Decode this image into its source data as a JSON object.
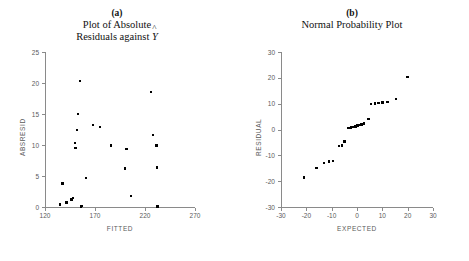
{
  "figure": {
    "background": "#ffffff",
    "point_color": "#000000",
    "axis_color": "#8a8a8a",
    "label_color": "#5a5a5a"
  },
  "panels": [
    {
      "letter": "(a)",
      "title_line1": "Plot of Absolute",
      "title_line2_pre": "Residuals against",
      "title_symbol": "Y",
      "title_symbol_accent": "^"
    },
    {
      "letter": "(b)",
      "title_line1": "Normal Probability Plot",
      "title_line2_pre": "",
      "title_symbol": "",
      "title_symbol_accent": ""
    }
  ],
  "chart_data": [
    {
      "type": "scatter",
      "title": "Plot of Absolute Residuals against Y-hat",
      "panel_letter": "(a)",
      "xlabel": "FITTED",
      "ylabel": "ABSRESID",
      "xlim": [
        120,
        270
      ],
      "ylim": [
        0,
        25
      ],
      "xticks": [
        120,
        170,
        220,
        270
      ],
      "yticks": [
        0,
        5,
        10,
        15,
        20,
        25
      ],
      "grid": false,
      "legend": "none",
      "n_points": 24,
      "x": [
        135.0,
        137.5,
        141.5,
        146.5,
        148.0,
        150.0,
        150.5,
        152.0,
        153.0,
        155.0,
        156.0,
        157.0,
        161.0,
        168.0,
        175.0,
        186.0,
        200.0,
        201.5,
        206.0,
        226.0,
        228.0,
        231.5,
        232.0,
        232.5
      ],
      "y": [
        0.4,
        3.8,
        0.7,
        1.2,
        1.5,
        10.3,
        9.5,
        12.4,
        15.0,
        20.3,
        0.1,
        0.2,
        4.7,
        13.2,
        12.9,
        9.9,
        6.2,
        9.4,
        1.8,
        18.5,
        11.6,
        9.9,
        6.4,
        0.1
      ]
    },
    {
      "type": "scatter",
      "title": "Normal Probability Plot",
      "panel_letter": "(b)",
      "xlabel": "EXPECTED",
      "ylabel": "RESIDUAL",
      "xlim": [
        -30,
        30
      ],
      "ylim": [
        -30,
        30
      ],
      "xticks": [
        -30,
        -20,
        -10,
        0,
        10,
        20,
        30
      ],
      "yticks": [
        -30,
        -20,
        -10,
        0,
        10,
        20,
        30
      ],
      "grid": false,
      "legend": "none",
      "n_points": 24,
      "x": [
        -21.0,
        -16.0,
        -13.0,
        -11.0,
        -9.5,
        -7.0,
        -6.0,
        -5.0,
        -3.5,
        -3.0,
        -2.3,
        -1.4,
        -0.6,
        0.2,
        1.0,
        1.8,
        2.8,
        4.5,
        5.5,
        7.0,
        8.5,
        10.0,
        12.0,
        15.5,
        20.0
      ],
      "y": [
        -18.6,
        -15.0,
        -13.0,
        -12.4,
        -12.2,
        -6.3,
        -6.2,
        -4.7,
        0.5,
        0.6,
        0.8,
        1.0,
        1.2,
        1.5,
        1.7,
        2.0,
        2.3,
        4.0,
        9.8,
        10.0,
        10.2,
        10.4,
        10.6,
        11.7,
        20.4
      ]
    }
  ]
}
